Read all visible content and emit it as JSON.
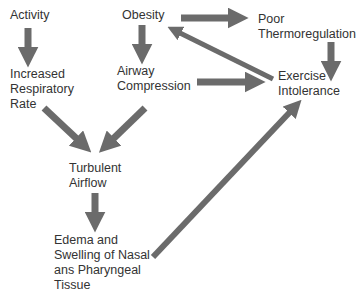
{
  "diagram": {
    "title": "",
    "colors": {
      "arrow": "#6b6b6b",
      "text": "#333333",
      "background": "#ffffff"
    },
    "nodes": {
      "activity": "Activity",
      "obesity": "Obesity",
      "poor_thermoregulation": "Poor\nThermoregulation",
      "increased_respiratory_rate": "Increased\nRespiratory\nRate",
      "airway_compression": "Airway\nCompression",
      "exercise_intolerance": "Exercise\nIntolerance",
      "turbulent_airflow": "Turbulent\nAirflow",
      "edema": "Edema and\nSwelling of Nasal\nans Pharyngeal\nTissue"
    },
    "edges": [
      {
        "from": "Activity",
        "to": "Increased Respiratory Rate"
      },
      {
        "from": "Obesity",
        "to": "Airway Compression"
      },
      {
        "from": "Obesity",
        "to": "Poor Thermoregulation"
      },
      {
        "from": "Exercise Intolerance",
        "to": "Obesity"
      },
      {
        "from": "Poor Thermoregulation",
        "to": "Exercise Intolerance"
      },
      {
        "from": "Airway Compression",
        "to": "Exercise Intolerance"
      },
      {
        "from": "Increased Respiratory Rate",
        "to": "Turbulent Airflow"
      },
      {
        "from": "Airway Compression",
        "to": "Turbulent Airflow"
      },
      {
        "from": "Turbulent Airflow",
        "to": "Edema and Swelling of Nasal ans Pharyngeal Tissue"
      },
      {
        "from": "Edema and Swelling of Nasal ans Pharyngeal Tissue",
        "to": "Exercise Intolerance"
      }
    ]
  }
}
